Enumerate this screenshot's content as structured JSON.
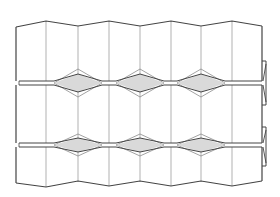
{
  "diagram": {
    "title": "",
    "type": "folded-panel-schematic",
    "colors": {
      "background": "#ffffff",
      "outline": "#444444",
      "fold_line": "#a8a8a8",
      "diamond_fill": "#d9d9d9",
      "diamond_outer": "#8a8a8a"
    },
    "fold_x": [
      16,
      46,
      78,
      109,
      140,
      171,
      201,
      232,
      262
    ],
    "top_edge_y": [
      27,
      21,
      26,
      21,
      26,
      21,
      26,
      21,
      26
    ],
    "bottom_edge_y": [
      183,
      187,
      181,
      186,
      181,
      186,
      181,
      186,
      181
    ],
    "seams": [
      {
        "name": "upper-seam",
        "y_top": 81,
        "y_bottom": 85,
        "diamond_centers_x": [
          78,
          140,
          201
        ],
        "diamond_half_width": 24,
        "inner_half_height": 9,
        "outer_half_height": 14
      },
      {
        "name": "lower-seam",
        "y_top": 143,
        "y_bottom": 147,
        "diamond_centers_x": [
          78,
          140,
          201
        ],
        "diamond_half_width": 24,
        "inner_half_height": 7,
        "outer_half_height": 11
      }
    ],
    "right_tabs": [
      {
        "name": "upper-tab",
        "y_top": 61,
        "y_bottom": 105
      },
      {
        "name": "lower-tab",
        "y_top": 127,
        "y_bottom": 166
      }
    ]
  }
}
